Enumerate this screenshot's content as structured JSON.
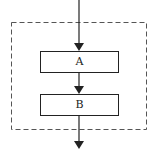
{
  "diagram": {
    "type": "flowchart-sequence",
    "nodes": [
      {
        "id": "A",
        "label": "A"
      },
      {
        "id": "B",
        "label": "B"
      }
    ],
    "edges": [
      {
        "from": "entry",
        "to": "A"
      },
      {
        "from": "A",
        "to": "B"
      },
      {
        "from": "B",
        "to": "exit"
      }
    ],
    "group": {
      "style": "dashed",
      "contains": [
        "A",
        "B"
      ]
    },
    "colors": {
      "stroke": "#222222",
      "group_stroke": "#555555"
    }
  }
}
